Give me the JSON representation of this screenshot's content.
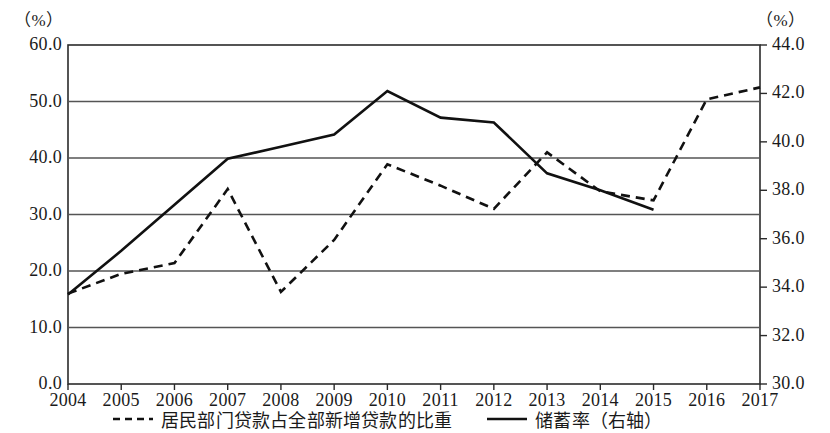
{
  "chart_data": {
    "type": "line",
    "title": "",
    "xlabel": "",
    "left_axis_unit": "（%）",
    "right_axis_unit": "（%）",
    "x": [
      2004,
      2005,
      2006,
      2007,
      2008,
      2009,
      2010,
      2011,
      2012,
      2013,
      2014,
      2015,
      2016,
      2017
    ],
    "categories": [
      "2004",
      "2005",
      "2006",
      "2007",
      "2008",
      "2009",
      "2010",
      "2011",
      "2012",
      "2013",
      "2014",
      "2015",
      "2016",
      "2017"
    ],
    "left_ticks": [
      "0.0",
      "10.0",
      "20.0",
      "30.0",
      "40.0",
      "50.0",
      "60.0"
    ],
    "left_tick_values": [
      0.0,
      10.0,
      20.0,
      30.0,
      40.0,
      50.0,
      60.0
    ],
    "right_ticks": [
      "30.0",
      "32.0",
      "34.0",
      "36.0",
      "38.0",
      "40.0",
      "42.0",
      "44.0"
    ],
    "right_tick_values": [
      30.0,
      32.0,
      34.0,
      36.0,
      38.0,
      40.0,
      42.0,
      44.0
    ],
    "ylim_left": [
      0.0,
      60.0
    ],
    "ylim_right": [
      30.0,
      44.0
    ],
    "grid": true,
    "legend_position": "bottom",
    "series": [
      {
        "name": "居民部门贷款占全部新增贷款的比重",
        "axis": "left",
        "style": "dashed",
        "color": "#111111",
        "values": [
          16.0,
          19.5,
          21.4,
          34.5,
          16.3,
          25.5,
          38.9,
          35.1,
          31.0,
          41.0,
          34.1,
          32.5,
          50.4,
          52.5
        ]
      },
      {
        "name": "储蓄率（右轴）",
        "axis": "right",
        "style": "solid",
        "color": "#111111",
        "values": [
          33.7,
          35.5,
          37.4,
          39.3,
          39.8,
          40.3,
          42.1,
          41.0,
          40.8,
          38.7,
          38.0,
          37.2,
          null,
          null
        ]
      }
    ]
  },
  "legend": {
    "items": [
      {
        "label": "居民部门贷款占全部新增贷款的比重",
        "marker": "dashed-line-marker"
      },
      {
        "label": "储蓄率（右轴）",
        "marker": "solid-line-marker"
      }
    ]
  }
}
